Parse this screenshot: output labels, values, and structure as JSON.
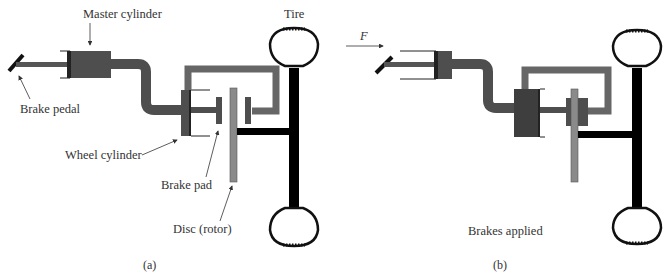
{
  "panel_a": {
    "labels": {
      "master_cylinder": "Master cylinder",
      "tire": "Tire",
      "brake_pedal": "Brake pedal",
      "wheel_cylinder": "Wheel cylinder",
      "brake_pad": "Brake pad",
      "disc": "Disc (rotor)"
    },
    "caption": "(a)"
  },
  "panel_b": {
    "force_label": "F",
    "status": "Brakes applied",
    "caption": "(b)"
  },
  "colors": {
    "fluid": "#5a5a5a",
    "piston": "#3d3d3d",
    "pipe": "#666666",
    "disc": "#8a8a8a",
    "axle": "#000000",
    "outline": "#111111"
  }
}
